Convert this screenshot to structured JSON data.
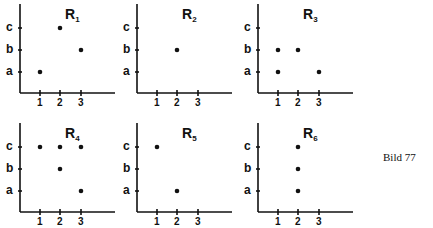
{
  "figure_label": "Bild 77",
  "y_categories": [
    "a",
    "b",
    "c"
  ],
  "x_categories": [
    "1",
    "2",
    "3"
  ],
  "chart_data": [
    {
      "type": "scatter",
      "title": "R1",
      "title_base": "R",
      "title_sub": "1",
      "points": [
        [
          1,
          "a"
        ],
        [
          2,
          "c"
        ],
        [
          3,
          "b"
        ]
      ]
    },
    {
      "type": "scatter",
      "title": "R2",
      "title_base": "R",
      "title_sub": "2",
      "points": [
        [
          2,
          "b"
        ]
      ]
    },
    {
      "type": "scatter",
      "title": "R3",
      "title_base": "R",
      "title_sub": "3",
      "points": [
        [
          1,
          "a"
        ],
        [
          1,
          "b"
        ],
        [
          2,
          "b"
        ],
        [
          3,
          "a"
        ]
      ]
    },
    {
      "type": "scatter",
      "title": "R4",
      "title_base": "R",
      "title_sub": "4",
      "points": [
        [
          1,
          "c"
        ],
        [
          2,
          "c"
        ],
        [
          3,
          "c"
        ],
        [
          2,
          "b"
        ],
        [
          3,
          "a"
        ]
      ]
    },
    {
      "type": "scatter",
      "title": "R5",
      "title_base": "R",
      "title_sub": "5",
      "points": [
        [
          1,
          "c"
        ],
        [
          2,
          "a"
        ]
      ]
    },
    {
      "type": "scatter",
      "title": "R6",
      "title_base": "R",
      "title_sub": "6",
      "points": [
        [
          2,
          "a"
        ],
        [
          2,
          "b"
        ],
        [
          2,
          "c"
        ]
      ]
    }
  ],
  "layout": {
    "panel_origins": [
      [
        0,
        0
      ],
      [
        117,
        0
      ],
      [
        238,
        0
      ],
      [
        0,
        119
      ],
      [
        117,
        119
      ],
      [
        238,
        119
      ]
    ]
  }
}
